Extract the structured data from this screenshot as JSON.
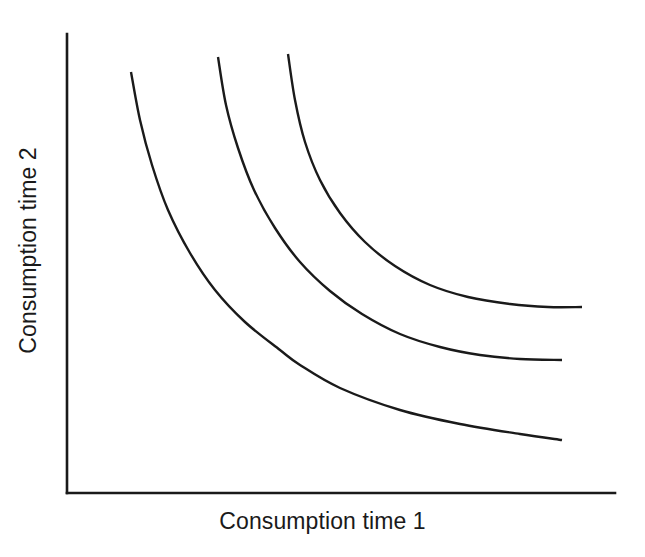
{
  "chart_data": {
    "type": "line",
    "title": "",
    "subtitle": "",
    "xlabel": "Consumption time 1",
    "ylabel": "Consumption time 2",
    "grid": false,
    "legend": "none",
    "axis": {
      "x_ticks": [],
      "y_ticks": [],
      "xlim_px": [
        67,
        615
      ],
      "ylim_px": [
        34,
        493
      ],
      "origin_px": [
        67,
        493
      ],
      "x_axis_end_px": [
        615,
        493
      ],
      "y_axis_top_px": [
        67,
        34
      ],
      "axis_color": "#1a1a1a",
      "axis_width_px": 2.6
    },
    "series": [
      {
        "name": "Indifference curve 1 (lowest)",
        "color": "#1a1a1a",
        "points_px": [
          [
            131,
            72
          ],
          [
            140,
            120
          ],
          [
            152,
            165
          ],
          [
            168,
            210
          ],
          [
            190,
            253
          ],
          [
            215,
            290
          ],
          [
            245,
            322
          ],
          [
            280,
            350
          ],
          [
            300,
            365
          ],
          [
            340,
            388
          ],
          [
            400,
            410
          ],
          [
            460,
            424
          ],
          [
            520,
            434
          ],
          [
            562,
            440
          ]
        ]
      },
      {
        "name": "Indifference curve 2 (middle)",
        "color": "#1a1a1a",
        "points_px": [
          [
            218,
            57
          ],
          [
            226,
            105
          ],
          [
            238,
            148
          ],
          [
            254,
            190
          ],
          [
            275,
            228
          ],
          [
            300,
            262
          ],
          [
            330,
            291
          ],
          [
            362,
            314
          ],
          [
            400,
            334
          ],
          [
            440,
            347
          ],
          [
            480,
            355
          ],
          [
            520,
            359
          ],
          [
            562,
            360
          ]
        ]
      },
      {
        "name": "Indifference curve 3 (highest)",
        "color": "#1a1a1a",
        "points_px": [
          [
            288,
            54
          ],
          [
            295,
            100
          ],
          [
            305,
            142
          ],
          [
            320,
            180
          ],
          [
            340,
            213
          ],
          [
            365,
            242
          ],
          [
            395,
            266
          ],
          [
            430,
            285
          ],
          [
            468,
            297
          ],
          [
            510,
            304
          ],
          [
            548,
            307
          ],
          [
            582,
            307
          ]
        ]
      }
    ]
  },
  "labels": {
    "x_axis": "Consumption time 1",
    "y_axis": "Consumption time 2"
  },
  "colors": {
    "background": "#ffffff",
    "ink": "#1a1a1a"
  }
}
